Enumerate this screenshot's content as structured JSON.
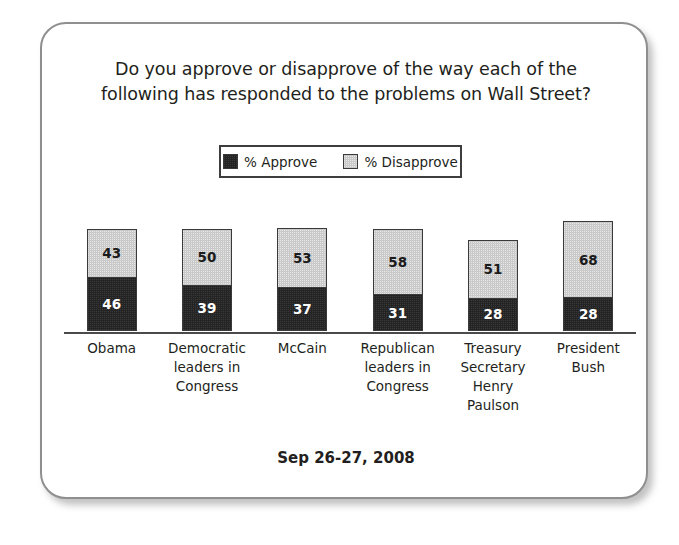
{
  "chart_data": {
    "type": "bar",
    "subtype": "stacked-bar-100",
    "title": "Do you approve or disapprove of the way each of the following has responded to the problems on Wall Street?",
    "title_lines": [
      "Do you approve or disapprove of the way each of the",
      "following has responded to the problems on Wall Street?"
    ],
    "xlabel": "",
    "ylabel": "",
    "ylim": [
      0,
      100
    ],
    "grid": false,
    "legend_position": "top-center",
    "categories": [
      "Obama",
      "Democratic leaders in Congress",
      "McCain",
      "Republican leaders in Congress",
      "Treasury Secretary Henry Paulson",
      "President Bush"
    ],
    "category_label_lines": [
      [
        "Obama"
      ],
      [
        "Democratic",
        "leaders in",
        "Congress"
      ],
      [
        "McCain"
      ],
      [
        "Republican",
        "leaders in",
        "Congress"
      ],
      [
        "Treasury",
        "Secretary",
        "Henry",
        "Paulson"
      ],
      [
        "President",
        "Bush"
      ]
    ],
    "series": [
      {
        "name": "% Approve",
        "color": "#242424",
        "values": [
          46,
          39,
          37,
          31,
          28,
          28
        ]
      },
      {
        "name": "% Disapprove",
        "color": "#c9c9c9",
        "values": [
          43,
          50,
          53,
          58,
          51,
          68
        ]
      }
    ],
    "annotation": "Sep 26-27, 2008"
  },
  "legend": {
    "entries": [
      {
        "label": "% Approve",
        "swatch": "dark-swatch-icon"
      },
      {
        "label": "% Disapprove",
        "swatch": "light-swatch-icon"
      }
    ]
  },
  "footer": {
    "date": "Sep 26-27, 2008"
  },
  "colors": {
    "approve": "#242424",
    "disapprove": "#c9c9c9",
    "card_border": "#8f8f8f",
    "axis": "#4a4a4a",
    "text": "#231f20"
  }
}
